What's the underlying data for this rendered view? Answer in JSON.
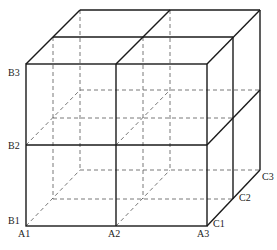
{
  "figure": {
    "type": "2x2x2 cube grid (perspective box divided into 8 sub-cubes)",
    "colors": {
      "solid_line": "#1a1a1a",
      "dashed_line": "#555555",
      "background": "#ffffff"
    },
    "labels": {
      "A1": "A1",
      "A2": "A2",
      "A3": "A3",
      "B1": "B1",
      "B2": "B2",
      "B3": "B3",
      "C1": "C1",
      "C2": "C2",
      "C3": "C3"
    }
  }
}
